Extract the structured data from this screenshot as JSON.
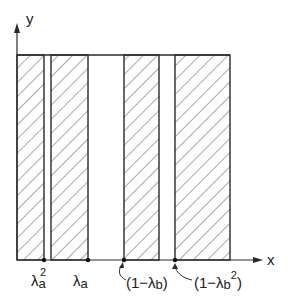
{
  "diagram": {
    "axes": {
      "x_label": "x",
      "y_label": "y"
    },
    "colors": {
      "line": "#2a2a2a",
      "hatch": "#555555",
      "background": "#ffffff"
    },
    "frame": {
      "left": 17,
      "right": 230,
      "top": 55,
      "bottom": 260
    },
    "hatched_strips": [
      {
        "name": "strip-1",
        "x0": 17,
        "x1": 44
      },
      {
        "name": "strip-2",
        "x0": 51,
        "x1": 88
      },
      {
        "name": "strip-3",
        "x0": 124,
        "x1": 159
      },
      {
        "name": "strip-4",
        "x0": 175,
        "x1": 230
      }
    ],
    "markers": [
      {
        "x": 44,
        "label": "λ",
        "sub": "a",
        "sup": "2"
      },
      {
        "x": 88,
        "label": "λ",
        "sub": "a",
        "sup": ""
      },
      {
        "x": 124,
        "label": "(1−λ",
        "sub": "b",
        "sup": "",
        "close": ")"
      },
      {
        "x": 175,
        "label": "(1−λ",
        "sub": "b",
        "sup": "2",
        "close": ")"
      }
    ],
    "tick_labels": {
      "m1": {
        "base": "λ",
        "sub": "a",
        "sup": "2"
      },
      "m2": {
        "base": "λ",
        "sub": "a"
      },
      "m3": {
        "base": "(1−λ",
        "sub": "b",
        "close": ")"
      },
      "m4": {
        "base": "(1−λ",
        "sub": "b",
        "sup": "2",
        "close": ")"
      }
    }
  }
}
